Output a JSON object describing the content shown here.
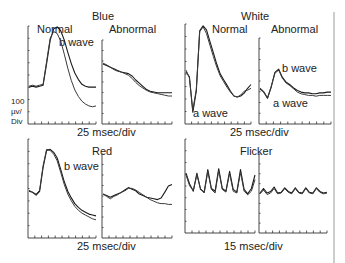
{
  "figure": {
    "scale_label": [
      "100",
      "µv/",
      "Div"
    ],
    "groups": [
      {
        "id": "blue",
        "title": "Blue",
        "timebase": "25 msec/div",
        "panels": [
          {
            "id": "blue-normal",
            "label": "Normal",
            "annotations": [
              "b wave"
            ],
            "traces": [
              [
                0.35,
                0.36,
                0.35,
                0.36,
                0.37,
                0.6,
                0.85,
                0.97,
                0.99,
                0.95,
                0.85,
                0.72,
                0.6,
                0.5,
                0.43,
                0.38,
                0.36,
                0.35,
                0.35,
                0.35
              ],
              [
                0.36,
                0.37,
                0.36,
                0.37,
                0.38,
                0.62,
                0.87,
                0.94,
                0.92,
                0.84,
                0.7,
                0.55,
                0.42,
                0.32,
                0.25,
                0.2,
                0.17,
                0.15,
                0.14,
                0.15
              ]
            ]
          },
          {
            "id": "blue-abnormal",
            "label": "Abnormal",
            "annotations": [],
            "traces": [
              [
                0.7,
                0.68,
                0.66,
                0.64,
                0.62,
                0.6,
                0.59,
                0.58,
                0.55,
                0.5,
                0.46,
                0.42,
                0.38,
                0.36,
                0.35,
                0.34,
                0.34,
                0.34,
                0.34,
                0.34
              ],
              [
                0.71,
                0.69,
                0.66,
                0.63,
                0.61,
                0.6,
                0.58,
                0.56,
                0.52,
                0.47,
                0.43,
                0.4,
                0.37,
                0.35,
                0.34,
                0.33,
                0.32,
                0.31,
                0.3,
                0.3
              ]
            ]
          }
        ]
      },
      {
        "id": "white",
        "title": "White",
        "timebase": "25 msec/div",
        "panels": [
          {
            "id": "white-normal",
            "label": "Normal",
            "annotations": [
              "a wave"
            ],
            "traces": [
              [
                0.5,
                0.45,
                0.08,
                0.3,
                0.93,
                0.98,
                0.94,
                0.82,
                0.7,
                0.58,
                0.48,
                0.42,
                0.36,
                0.3,
                0.25,
                0.24,
                0.25,
                0.28,
                0.33,
                0.37
              ],
              [
                0.52,
                0.44,
                0.1,
                0.32,
                0.92,
                0.97,
                0.9,
                0.78,
                0.66,
                0.55,
                0.46,
                0.4,
                0.34,
                0.29,
                0.25,
                0.24,
                0.26,
                0.3,
                0.31,
                0.33
              ]
            ]
          },
          {
            "id": "white-abnormal",
            "label": "Abnormal",
            "annotations": [
              "b wave",
              "a wave"
            ],
            "traces": [
              [
                0.38,
                0.34,
                0.27,
                0.4,
                0.58,
                0.62,
                0.52,
                0.46,
                0.43,
                0.39,
                0.36,
                0.34,
                0.33,
                0.33,
                0.32,
                0.32,
                0.33,
                0.33,
                0.34,
                0.34
              ],
              [
                0.39,
                0.35,
                0.26,
                0.41,
                0.57,
                0.61,
                0.51,
                0.45,
                0.42,
                0.38,
                0.34,
                0.32,
                0.31,
                0.3,
                0.3,
                0.29,
                0.3,
                0.3,
                0.3,
                0.3
              ]
            ]
          }
        ]
      },
      {
        "id": "red",
        "title": "Red",
        "timebase": "25 msec/div",
        "panels": [
          {
            "id": "red-normal",
            "label": "",
            "annotations": [
              "b wave"
            ],
            "traces": [
              [
                0.45,
                0.44,
                0.41,
                0.45,
                0.7,
                0.88,
                0.89,
                0.86,
                0.8,
                0.68,
                0.55,
                0.45,
                0.38,
                0.32,
                0.28,
                0.25,
                0.23,
                0.21,
                0.2,
                0.19
              ],
              [
                0.46,
                0.44,
                0.42,
                0.46,
                0.72,
                0.89,
                0.88,
                0.84,
                0.77,
                0.65,
                0.52,
                0.42,
                0.35,
                0.29,
                0.25,
                0.22,
                0.2,
                0.18,
                0.16,
                0.15
              ]
            ]
          },
          {
            "id": "red-abnormal",
            "label": "",
            "annotations": [],
            "traces": [
              [
                0.5,
                0.48,
                0.46,
                0.48,
                0.5,
                0.52,
                0.55,
                0.58,
                0.56,
                0.54,
                0.5,
                0.48,
                0.46,
                0.45,
                0.44,
                0.43,
                0.45,
                0.52,
                0.6,
                0.62
              ],
              [
                0.5,
                0.47,
                0.44,
                0.47,
                0.49,
                0.52,
                0.54,
                0.57,
                0.57,
                0.55,
                0.52,
                0.49,
                0.46,
                0.43,
                0.41,
                0.39,
                0.38,
                0.38,
                0.37,
                0.37
              ]
            ]
          }
        ]
      },
      {
        "id": "flicker",
        "title": "Flicker",
        "timebase": "15 msec/div",
        "panels": [
          {
            "id": "flicker-normal",
            "label": "",
            "annotations": [],
            "traces": [
              [
                0.62,
                0.5,
                0.42,
                0.62,
                0.44,
                0.41,
                0.66,
                0.45,
                0.42,
                0.67,
                0.45,
                0.42,
                0.64,
                0.44,
                0.41,
                0.66,
                0.44,
                0.39,
                0.45,
                0.6
              ],
              [
                0.6,
                0.48,
                0.43,
                0.6,
                0.45,
                0.4,
                0.64,
                0.44,
                0.4,
                0.65,
                0.44,
                0.41,
                0.62,
                0.42,
                0.4,
                0.63,
                0.42,
                0.38,
                0.42,
                0.55
              ]
            ]
          },
          {
            "id": "flicker-abnormal",
            "label": "",
            "annotations": [],
            "traces": [
              [
                0.48,
                0.54,
                0.48,
                0.5,
                0.56,
                0.48,
                0.49,
                0.55,
                0.5,
                0.48,
                0.55,
                0.49,
                0.48,
                0.55,
                0.49,
                0.48,
                0.55,
                0.5,
                0.48,
                0.49
              ],
              [
                0.47,
                0.52,
                0.46,
                0.48,
                0.54,
                0.47,
                0.48,
                0.54,
                0.49,
                0.47,
                0.54,
                0.48,
                0.47,
                0.54,
                0.48,
                0.47,
                0.54,
                0.49,
                0.47,
                0.48
              ]
            ]
          }
        ]
      }
    ]
  }
}
